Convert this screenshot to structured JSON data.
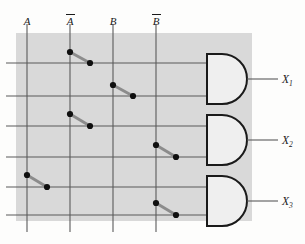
{
  "diagram": {
    "canvas": {
      "width": 305,
      "height": 244
    },
    "panel": {
      "x": 16,
      "y": 33,
      "width": 236,
      "height": 188,
      "fill": "#d9d9d9"
    },
    "colors": {
      "panel_fill": "#d9d9d9",
      "wire": "#5a5a5a",
      "gate_stroke": "#1a1a1a",
      "gate_fill": "#efefef",
      "link": "#8c8c8c",
      "dot": "#101010",
      "background": "#fdfdfc",
      "text": "#1a1a1a"
    },
    "input_columns": [
      {
        "name": "A",
        "glyph": "A",
        "overbar": false,
        "x": 27,
        "label_x": 27,
        "label_y": 14
      },
      {
        "name": "Abar",
        "glyph": "A",
        "overbar": true,
        "x": 70,
        "label_x": 70,
        "label_y": 14
      },
      {
        "name": "B",
        "glyph": "B",
        "overbar": false,
        "x": 113,
        "label_x": 113,
        "label_y": 14
      },
      {
        "name": "Bbar",
        "glyph": "B",
        "overbar": true,
        "x": 156,
        "label_x": 156,
        "label_y": 14
      }
    ],
    "column_line": {
      "y_top": 24,
      "y_bottom": 232
    },
    "product_rows": [
      {
        "index": 1,
        "y": 63,
        "x_start": 6,
        "x_end": 207
      },
      {
        "index": 2,
        "y": 96,
        "x_start": 6,
        "x_end": 207
      },
      {
        "index": 3,
        "y": 126,
        "x_start": 6,
        "x_end": 207
      },
      {
        "index": 4,
        "y": 157,
        "x_start": 6,
        "x_end": 207
      },
      {
        "index": 5,
        "y": 187,
        "x_start": 6,
        "x_end": 207
      },
      {
        "index": 6,
        "y": 215,
        "x_start": 6,
        "x_end": 207
      }
    ],
    "connections": [
      {
        "id": "c1",
        "input": "Abar",
        "row": 1,
        "from_x": 70,
        "from_y": 52,
        "to_x": 90,
        "to_y": 63
      },
      {
        "id": "c2",
        "input": "B",
        "row": 2,
        "from_x": 113,
        "from_y": 85,
        "to_x": 133,
        "to_y": 96
      },
      {
        "id": "c3",
        "input": "Abar",
        "row": 3,
        "from_x": 70,
        "from_y": 114,
        "to_x": 90,
        "to_y": 126
      },
      {
        "id": "c4",
        "input": "Bbar",
        "row": 4,
        "from_x": 156,
        "from_y": 145,
        "to_x": 176,
        "to_y": 157
      },
      {
        "id": "c5",
        "input": "A",
        "row": 5,
        "from_x": 27,
        "from_y": 175,
        "to_x": 47,
        "to_y": 187
      },
      {
        "id": "c6",
        "input": "Bbar",
        "row": 6,
        "from_x": 156,
        "from_y": 203,
        "to_x": 176,
        "to_y": 215
      }
    ],
    "gates": [
      {
        "id": "gate1",
        "type": "AND",
        "x": 207,
        "y": 54,
        "width": 40,
        "height": 50,
        "output_label": "X",
        "output_sub": "1",
        "out_y": 79,
        "out_line_end": 278,
        "label_x": 282,
        "label_y": 74
      },
      {
        "id": "gate2",
        "type": "AND",
        "x": 207,
        "y": 115,
        "width": 40,
        "height": 50,
        "output_label": "X",
        "output_sub": "2",
        "out_y": 140,
        "out_line_end": 278,
        "label_x": 282,
        "label_y": 135
      },
      {
        "id": "gate3",
        "type": "AND",
        "x": 207,
        "y": 176,
        "width": 40,
        "height": 50,
        "output_label": "X",
        "output_sub": "3",
        "out_y": 201,
        "out_line_end": 278,
        "label_x": 282,
        "label_y": 196
      }
    ],
    "gate_inputs": [
      {
        "gate": "gate1",
        "rows": [
          1,
          2
        ]
      },
      {
        "gate": "gate2",
        "rows": [
          3,
          4
        ]
      },
      {
        "gate": "gate3",
        "rows": [
          5,
          6
        ]
      }
    ]
  }
}
